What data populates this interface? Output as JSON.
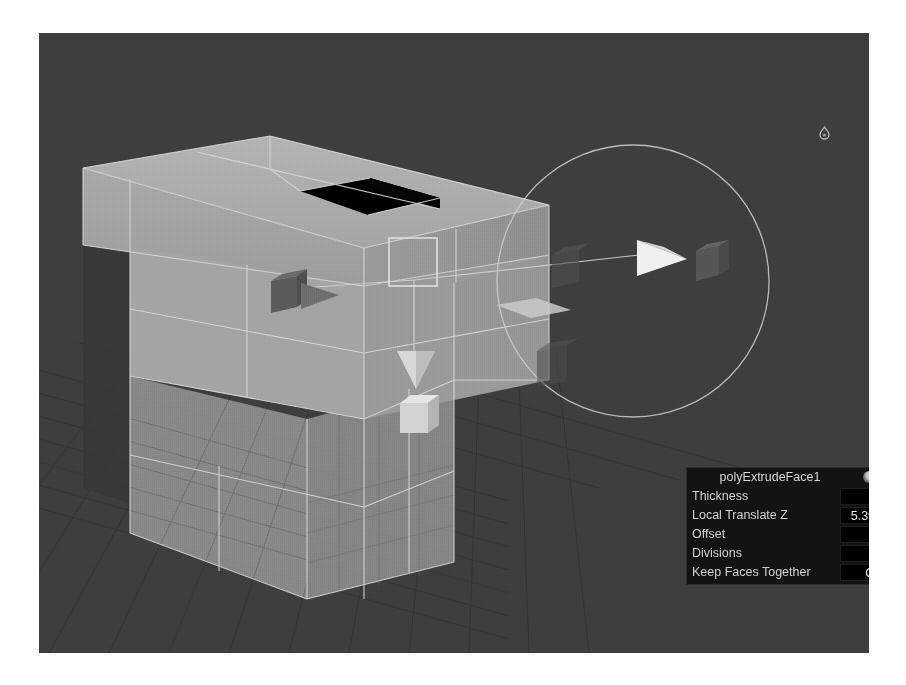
{
  "app": {
    "viewport_label": "perspective-viewport",
    "background_color": "#3e3e3e",
    "grid_color": "#2c2c2c",
    "mesh_fill_color": "#a8a8a8",
    "mesh_wire_color": "#d8d8d8",
    "hole_color": "#000000",
    "manipulator_color": "#cfcfcf",
    "panel_bg_color": "#131313",
    "panel_field_color": "#000000",
    "panel_text_color": "#d2d2d2"
  },
  "attribute_panel": {
    "title": "polyExtrudeFace1",
    "icons": {
      "preset_icon": "sphere-preset-icon",
      "menu_icon": "dot-menu-icon"
    },
    "rows": [
      {
        "label": "Thickness",
        "value": "0"
      },
      {
        "label": "Local Translate Z",
        "value": "5.392"
      },
      {
        "label": "Offset",
        "value": "0"
      },
      {
        "label": "Divisions",
        "value": "1"
      },
      {
        "label": "Keep Faces Together",
        "value": "On"
      }
    ]
  },
  "overlay": {
    "tool_badge_icon": "swirl-tool-icon"
  },
  "manipulator": {
    "name": "extrude-manipulator",
    "circle_center_x": 633,
    "circle_center_y": 281,
    "circle_radius": 136,
    "handles": [
      {
        "name": "center-square-handle",
        "type": "square"
      },
      {
        "name": "x-axis-arrow-handle",
        "type": "cone-arrow"
      },
      {
        "name": "negative-x-cube-handle",
        "type": "cube"
      },
      {
        "name": "y-axis-arrow-handle",
        "type": "cone-arrow"
      },
      {
        "name": "y-axis-cube-handle",
        "type": "cube"
      },
      {
        "name": "plane-handle",
        "type": "quad"
      },
      {
        "name": "far-cube-handle",
        "type": "cube"
      },
      {
        "name": "ghost-cube-handle",
        "type": "cube"
      }
    ]
  }
}
